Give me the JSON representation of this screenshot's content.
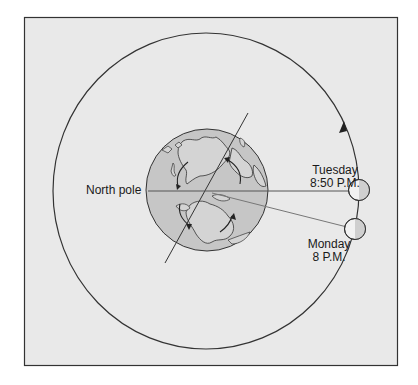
{
  "diagram": {
    "colors": {
      "frame_bg": "#e9e9e9",
      "frame_border": "#333333",
      "earth_fill": "#c6c6c6",
      "land_fill": "#d4d4d4",
      "line": "#333333",
      "pointer_line": "#777777",
      "moon_light": "#f2f2f2",
      "moon_dark": "#cfcfcf"
    },
    "labels": {
      "north_pole": "North pole",
      "tuesday_day": "Tuesday",
      "tuesday_time": "8:50 P.M.",
      "monday_day": "Monday",
      "monday_time": "8 P.M."
    },
    "elements": {
      "orbit": "Moon orbit (counter-clockwise arrow)",
      "earth": "Earth viewed from above North pole",
      "moon_positions": [
        "Monday 8 P.M.",
        "Tuesday 8:50 P.M."
      ]
    }
  }
}
